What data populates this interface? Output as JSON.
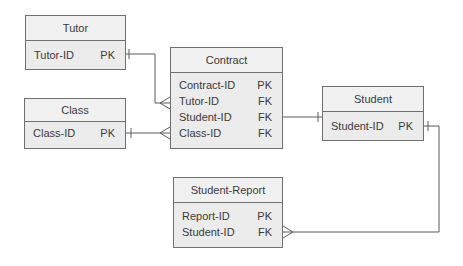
{
  "entities": {
    "tutor": {
      "title": "Tutor",
      "rows": [
        {
          "name": "Tutor-ID",
          "key": "PK"
        }
      ]
    },
    "class": {
      "title": "Class",
      "rows": [
        {
          "name": "Class-ID",
          "key": "PK"
        }
      ]
    },
    "contract": {
      "title": "Contract",
      "rows": [
        {
          "name": "Contract-ID",
          "key": "PK"
        },
        {
          "name": "Tutor-ID",
          "key": "FK"
        },
        {
          "name": "Student-ID",
          "key": "FK"
        },
        {
          "name": "Class-ID",
          "key": "FK"
        }
      ]
    },
    "student": {
      "title": "Student",
      "rows": [
        {
          "name": "Student-ID",
          "key": "PK"
        }
      ]
    },
    "student_report": {
      "title": "Student-Report",
      "rows": [
        {
          "name": "Report-ID",
          "key": "PK"
        },
        {
          "name": "Student-ID",
          "key": "FK"
        }
      ]
    }
  },
  "relationships": [
    {
      "from": "Tutor.Tutor-ID",
      "to": "Contract.Tutor-ID",
      "from_cardinality": "one",
      "to_cardinality": "many"
    },
    {
      "from": "Class.Class-ID",
      "to": "Contract.Class-ID",
      "from_cardinality": "one",
      "to_cardinality": "many"
    },
    {
      "from": "Contract.Student-ID",
      "to": "Student.Student-ID",
      "from_cardinality": "none",
      "to_cardinality": "one"
    },
    {
      "from": "Student.Student-ID",
      "to": "Student-Report.Student-ID",
      "from_cardinality": "one",
      "to_cardinality": "many"
    }
  ]
}
